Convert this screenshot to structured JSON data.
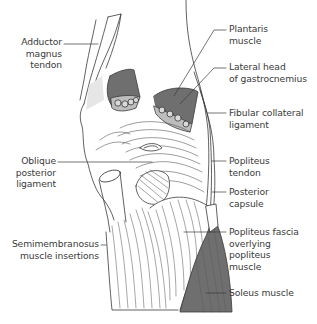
{
  "diagram": {
    "colors": {
      "line": "#3a3a3a",
      "muscle_fill": "#6f6f6f",
      "bone_fill": "#bdbdbd",
      "tendon_fill": "#e6e6e6",
      "background": "#ffffff"
    },
    "labels": {
      "adductor": {
        "line1": "Adductor",
        "line2": "magnus",
        "line3": "tendon"
      },
      "oblique": {
        "line1": "Oblique",
        "line2": "posterior",
        "line3": "ligament"
      },
      "semimembranosus": {
        "line1": "Semimembranosus",
        "line2": "muscle insertions"
      },
      "plantaris": {
        "line1": "Plantaris",
        "line2": "muscle"
      },
      "lateral_gastroc": {
        "line1": "Lateral head",
        "line2": "of gastrocnemius"
      },
      "fibular": {
        "line1": "Fibular collateral",
        "line2": "ligament"
      },
      "popliteus_tendon": {
        "line1": "Popliteus",
        "line2": "tendon"
      },
      "posterior_capsule": {
        "line1": "Posterior",
        "line2": "capsule"
      },
      "popliteus_fascia": {
        "line1": "Popliteus fascia",
        "line2": "overlying",
        "line3": "popliteus",
        "line4": "muscle"
      },
      "soleus": {
        "line1": "Soleus muscle"
      }
    }
  }
}
